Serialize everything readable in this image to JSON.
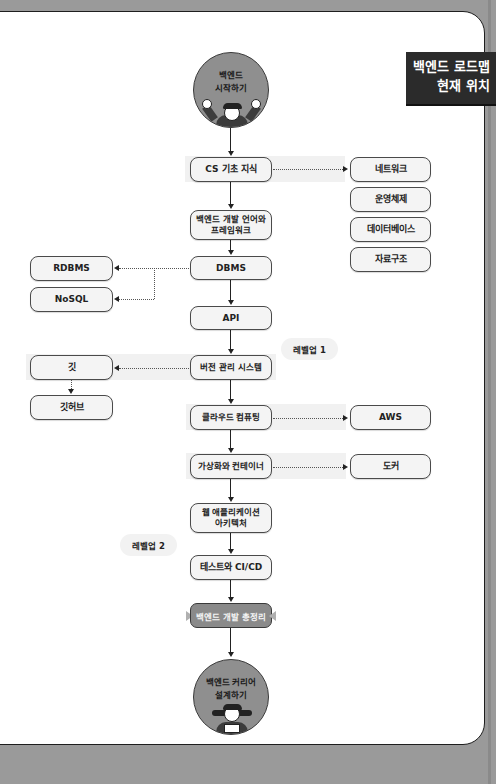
{
  "tag": {
    "line1": "백엔드 로드맵",
    "line2": "현재 위치"
  },
  "start": {
    "label": "백엔드\n시작하기",
    "icon": "cheering-developer-icon"
  },
  "end": {
    "label": "백엔드 커리어\n설계하기",
    "icon": "thumbs-up-developer-icon"
  },
  "main_steps": [
    {
      "id": "cs",
      "label": "CS 기초 지식"
    },
    {
      "id": "lang",
      "label": "백엔드 개발 언어와\n프레임워크"
    },
    {
      "id": "dbms",
      "label": "DBMS"
    },
    {
      "id": "api",
      "label": "API"
    },
    {
      "id": "vcs",
      "label": "버전 관리 시스템"
    },
    {
      "id": "cloud",
      "label": "클라우드 컴퓨팅"
    },
    {
      "id": "virt",
      "label": "가상화와 컨테이너"
    },
    {
      "id": "webarch",
      "label": "웹 애플리케이션\n아키텍처"
    },
    {
      "id": "cicd",
      "label": "테스트와 CI/CD"
    }
  ],
  "summary": {
    "label": "백엔드 개발 총정리"
  },
  "cs_topics": [
    "네트워크",
    "운영체제",
    "데이터베이스",
    "자료구조"
  ],
  "dbms_types": [
    "RDBMS",
    "NoSQL"
  ],
  "vcs_tools": [
    "깃",
    "깃허브"
  ],
  "cloud_tools": [
    "AWS"
  ],
  "container_tools": [
    "도커"
  ],
  "levelups": [
    "레벨업 1",
    "레벨업 2"
  ],
  "colors": {
    "background": "#9a9a9a",
    "card": "#ffffff",
    "node_fill": "#f4f4f4",
    "circle_fill": "#8f8f8f",
    "tag_fill": "#2b2b2b",
    "summary_fill": "#8a8a8a"
  }
}
